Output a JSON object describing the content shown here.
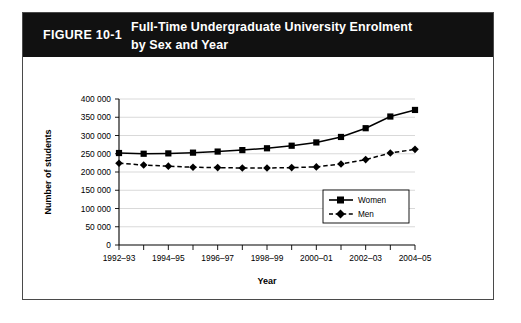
{
  "figure": {
    "number": "FIGURE 10-1",
    "title_line1": "Full-Time Undergraduate University Enrolment",
    "title_line2": "by Sex and Year",
    "header_bg": "#111111",
    "header_text_color": "#ffffff",
    "border_color": "#4a4a4a"
  },
  "chart_data": {
    "type": "line",
    "title": "Full-Time Undergraduate University Enrolment by Sex and Year",
    "xlabel": "Year",
    "ylabel": "Number of students",
    "ylim": [
      0,
      400000
    ],
    "ytick_step": 50000,
    "ytick_labels": [
      "0",
      "50 000",
      "100 000",
      "150 000",
      "200 000",
      "250 000",
      "300 000",
      "350 000",
      "400 000"
    ],
    "ytick_values": [
      0,
      50000,
      100000,
      150000,
      200000,
      250000,
      300000,
      350000,
      400000
    ],
    "grid": true,
    "grid_axis": "y",
    "legend_position": "lower right",
    "categories": [
      "1992-93",
      "1993-94",
      "1994-95",
      "1995-96",
      "1996-97",
      "1997-98",
      "1998-99",
      "1999-00",
      "2000-01",
      "2001-02",
      "2002-03",
      "2003-04",
      "2004-05"
    ],
    "xtick_labels_shown": [
      "1992–93",
      "1994–95",
      "1996–97",
      "1998–99",
      "2000–01",
      "2002–03",
      "2004–05"
    ],
    "series": [
      {
        "name": "Women",
        "marker": "square",
        "line_style": "solid",
        "color": "#000000",
        "values": [
          252000,
          250000,
          251000,
          253000,
          256000,
          260000,
          265000,
          272000,
          281000,
          296000,
          320000,
          352000,
          370000
        ]
      },
      {
        "name": "Men",
        "marker": "diamond",
        "line_style": "dashed",
        "color": "#000000",
        "values": [
          224000,
          219000,
          216000,
          213000,
          212000,
          211000,
          211000,
          212000,
          214000,
          222000,
          234000,
          252000,
          262000
        ]
      }
    ]
  }
}
